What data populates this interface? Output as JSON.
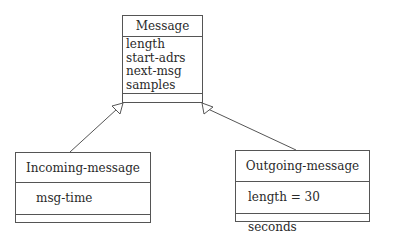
{
  "diagram": {
    "type": "uml-class-inheritance",
    "classes": [
      {
        "id": "message",
        "name": "Message",
        "attributes": [
          "length",
          "start-adrs",
          "next-msg",
          "samples"
        ],
        "operations": []
      },
      {
        "id": "incoming",
        "name": "Incoming-message",
        "attributes": [
          "msg-time"
        ],
        "operations": []
      },
      {
        "id": "outgoing",
        "name": "Outgoing-message",
        "attributes": [
          "length = 30 seconds"
        ],
        "operations": []
      }
    ],
    "relations": [
      {
        "from": "Incoming-message",
        "to": "Message",
        "kind": "generalization"
      },
      {
        "from": "Outgoing-message",
        "to": "Message",
        "kind": "generalization"
      }
    ],
    "colors": {
      "line": "#555555",
      "text": "#2a2a2a",
      "background": "#ffffff"
    }
  }
}
